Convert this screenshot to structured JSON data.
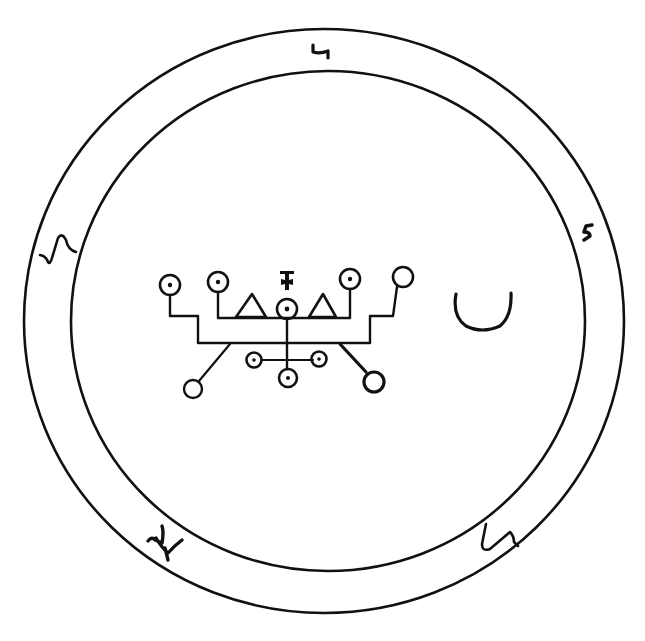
{
  "figure": {
    "type": "seal",
    "ink_color": "#111111",
    "background_color": "#ffffff"
  },
  "rings": {
    "outer": {
      "cx": 324,
      "cy": 321,
      "rx": 300,
      "ry": 292
    },
    "inner": {
      "cx": 328,
      "cy": 321,
      "rx": 257,
      "ry": 250
    }
  },
  "ring_glyphs": [
    {
      "id": "top",
      "x": 318,
      "y": 50,
      "label": "glyph-top"
    },
    {
      "id": "right",
      "x": 589,
      "y": 230,
      "label": "glyph-right"
    },
    {
      "id": "left",
      "x": 55,
      "y": 250,
      "label": "glyph-left"
    },
    {
      "id": "bottom-left",
      "x": 160,
      "y": 540,
      "label": "glyph-bottom-left"
    },
    {
      "id": "bottom-right",
      "x": 500,
      "y": 540,
      "label": "glyph-bottom-right"
    }
  ],
  "central_sigil": {
    "label": "central-sigil",
    "crescent": {
      "cx": 482,
      "cy": 305,
      "label": "crescent"
    }
  }
}
